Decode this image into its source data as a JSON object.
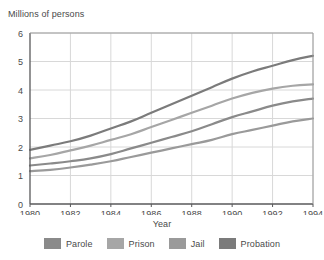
{
  "chart_data": {
    "type": "line",
    "title": "",
    "ylabel": "Millions of persons",
    "xlabel": "Year",
    "x": [
      1980,
      1981,
      1982,
      1983,
      1984,
      1985,
      1986,
      1987,
      1988,
      1989,
      1990,
      1991,
      1992,
      1993,
      1994
    ],
    "xlim": [
      1980,
      1994
    ],
    "ylim": [
      0,
      6
    ],
    "xticks": [
      1980,
      1982,
      1984,
      1986,
      1988,
      1990,
      1992,
      1994
    ],
    "xtick_labels": [
      "1980",
      "1982",
      "1984",
      "1986",
      "1988",
      "1990",
      "1992",
      "1994"
    ],
    "yticks": [
      0,
      1,
      2,
      3,
      4,
      5,
      6
    ],
    "ytick_labels": [
      "0",
      "1",
      "2",
      "3",
      "4",
      "5",
      "6"
    ],
    "grid": true,
    "legend_position": "bottom",
    "series": [
      {
        "name": "Parole",
        "color": "#8a8a8a",
        "values": [
          1.35,
          1.42,
          1.5,
          1.6,
          1.75,
          1.95,
          2.15,
          2.35,
          2.55,
          2.8,
          3.05,
          3.25,
          3.45,
          3.6,
          3.7
        ]
      },
      {
        "name": "Prison",
        "color": "#a6a6a6",
        "values": [
          1.6,
          1.72,
          1.88,
          2.05,
          2.25,
          2.45,
          2.7,
          2.95,
          3.2,
          3.45,
          3.7,
          3.9,
          4.05,
          4.15,
          4.2
        ]
      },
      {
        "name": "Jail",
        "color": "#9a9a9a",
        "values": [
          1.15,
          1.2,
          1.28,
          1.38,
          1.5,
          1.65,
          1.8,
          1.95,
          2.1,
          2.25,
          2.45,
          2.6,
          2.75,
          2.9,
          3.0
        ]
      },
      {
        "name": "Probation",
        "color": "#7b7b7b",
        "values": [
          1.9,
          2.05,
          2.2,
          2.4,
          2.65,
          2.9,
          3.2,
          3.5,
          3.8,
          4.1,
          4.4,
          4.65,
          4.85,
          5.05,
          5.2
        ]
      }
    ]
  },
  "axes": {
    "y_title": "Millions of persons",
    "x_title": "Year"
  },
  "legend": {
    "items": [
      {
        "label": "Parole",
        "color": "#8a8a8a"
      },
      {
        "label": "Prison",
        "color": "#a6a6a6"
      },
      {
        "label": "Jail",
        "color": "#9a9a9a"
      },
      {
        "label": "Probation",
        "color": "#7b7b7b"
      }
    ]
  },
  "style": {
    "grid_color": "#d8d8d8",
    "axis_color": "#58585a",
    "text_color": "#4a4a4a",
    "background": "#ffffff"
  }
}
